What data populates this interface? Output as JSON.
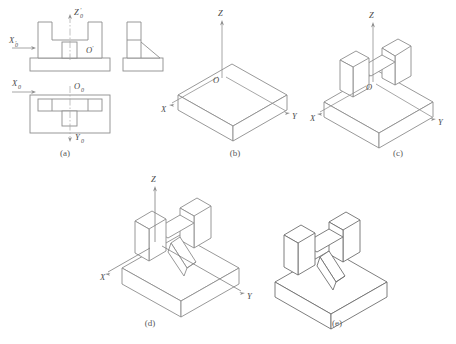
{
  "figure": {
    "background": "#ffffff",
    "line_color": "#8d8d8d",
    "dark_line_color": "#6f6f6f",
    "axis_color": "#909090",
    "centerline_color": "#a8a8a8",
    "label_color": "#4a4a4a"
  },
  "panels": [
    {
      "id": "a",
      "caption": "(a)",
      "description": "orthographic-three-views",
      "labels": {
        "x_front": "X",
        "x_front_prime": "′",
        "x_front_sub": "0",
        "z_front": "Z",
        "z_front_prime": "′",
        "z_front_sub": "0",
        "o_front": "O",
        "o_front_prime": "′",
        "x_top": "X",
        "x_top_sub": "0",
        "o_top": "O",
        "o_top_sub": "0",
        "y_top": "Y",
        "y_top_sub": "0"
      }
    },
    {
      "id": "b",
      "caption": "(b)",
      "description": "isometric-base-plate",
      "labels": {
        "x": "X",
        "y": "Y",
        "z": "Z",
        "o": "O"
      }
    },
    {
      "id": "c",
      "caption": "(c)",
      "description": "isometric-base-plus-u-block",
      "labels": {
        "x": "X",
        "y": "Y",
        "z": "Z",
        "o": "O"
      }
    },
    {
      "id": "d",
      "caption": "(d)",
      "description": "isometric-base-u-block-plus-slanted-rib",
      "labels": {
        "x": "X",
        "y": "Y",
        "z": "Z"
      }
    },
    {
      "id": "e",
      "caption": "(e)",
      "description": "final-isometric-solid-no-axes",
      "labels": {}
    }
  ]
}
